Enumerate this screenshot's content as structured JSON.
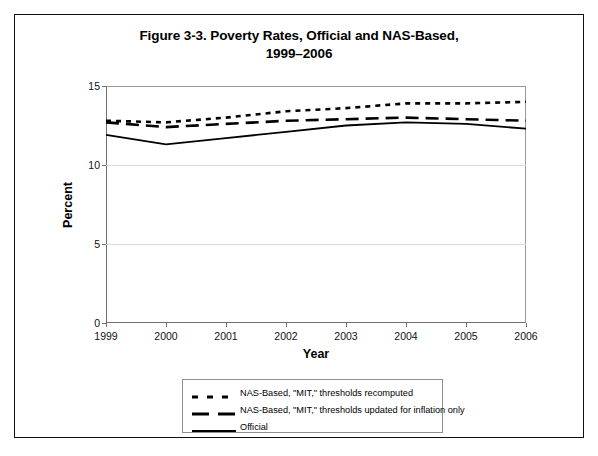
{
  "figure": {
    "title_line1": "Figure 3-3. Poverty Rates, Official and NAS-Based,",
    "title_line2": "1999–2006"
  },
  "axes": {
    "y_title": "Percent",
    "x_title": "Year",
    "y_ticks": [
      "0",
      "5",
      "10",
      "15"
    ],
    "x_ticks": [
      "1999",
      "2000",
      "2001",
      "2002",
      "2003",
      "2004",
      "2005",
      "2006"
    ]
  },
  "legend": {
    "items": [
      {
        "label": "NAS-Based, \"MIT,\" thresholds recomputed",
        "style": "dotted",
        "color": "#000000"
      },
      {
        "label": "NAS-Based, \"MIT,\" thresholds updated for inflation only",
        "style": "dashed",
        "color": "#000000"
      },
      {
        "label": "Official",
        "style": "solid",
        "color": "#000000"
      }
    ]
  },
  "chart_data": {
    "type": "line",
    "title": "Figure 3-3. Poverty Rates, Official and NAS-Based, 1999–2006",
    "xlabel": "Year",
    "ylabel": "Percent",
    "x": [
      1999,
      2000,
      2001,
      2002,
      2003,
      2004,
      2005,
      2006
    ],
    "xlim": [
      1999,
      2006
    ],
    "ylim": [
      0,
      15
    ],
    "yticks": [
      0,
      5,
      10,
      15
    ],
    "grid": true,
    "legend_position": "below-plot",
    "series": [
      {
        "name": "NAS-Based, \"MIT,\" thresholds recomputed",
        "style": "dotted",
        "color": "#000000",
        "values": [
          12.8,
          12.7,
          13.0,
          13.4,
          13.6,
          13.9,
          13.9,
          14.0
        ]
      },
      {
        "name": "NAS-Based, \"MIT,\" thresholds updated for inflation only",
        "style": "dashed",
        "color": "#000000",
        "values": [
          12.7,
          12.4,
          12.6,
          12.8,
          12.9,
          13.0,
          12.9,
          12.8
        ]
      },
      {
        "name": "Official",
        "style": "solid",
        "color": "#000000",
        "values": [
          11.9,
          11.3,
          11.7,
          12.1,
          12.5,
          12.7,
          12.6,
          12.3
        ]
      }
    ]
  }
}
